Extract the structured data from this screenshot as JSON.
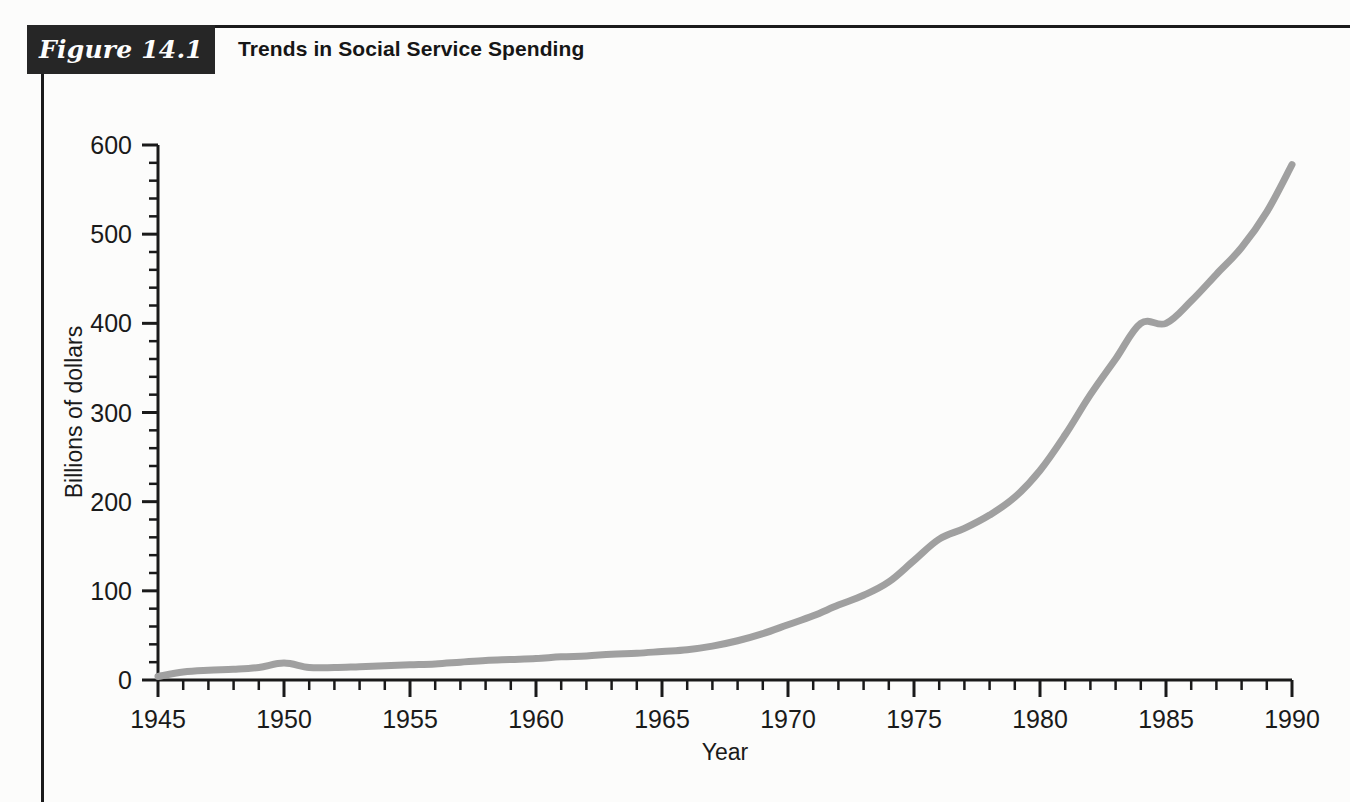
{
  "figure": {
    "tag": "Figure 14.1",
    "title": "Trends in Social Service Spending"
  },
  "chart_data": {
    "type": "line",
    "title": "Trends in Social Service Spending",
    "xlabel": "Year",
    "ylabel": "Billions of dollars",
    "xlim": [
      1945,
      1990
    ],
    "ylim": [
      0,
      600
    ],
    "xticks": [
      1945,
      1950,
      1955,
      1960,
      1965,
      1970,
      1975,
      1980,
      1985,
      1990
    ],
    "xtick_labels": [
      "1945",
      "1950",
      "1955",
      "1960",
      "1965",
      "1970",
      "1975",
      "1980",
      "1985",
      "1990"
    ],
    "x_minor_step": 1,
    "yticks": [
      0,
      100,
      200,
      300,
      400,
      500,
      600
    ],
    "ytick_labels": [
      "0",
      "100",
      "200",
      "300",
      "400",
      "500",
      "600"
    ],
    "y_minor_step": 20,
    "grid": false,
    "legend": null,
    "line_color": "#a0a0a0",
    "line_width": 7,
    "series": [
      {
        "name": "Social service spending",
        "x": [
          1945,
          1946,
          1947,
          1948,
          1949,
          1950,
          1951,
          1952,
          1953,
          1954,
          1955,
          1956,
          1957,
          1958,
          1959,
          1960,
          1961,
          1962,
          1963,
          1964,
          1965,
          1966,
          1967,
          1968,
          1969,
          1970,
          1971,
          1972,
          1973,
          1974,
          1975,
          1976,
          1977,
          1978,
          1979,
          1980,
          1981,
          1982,
          1983,
          1984,
          1985,
          1986,
          1987,
          1988,
          1989,
          1990
        ],
        "values": [
          4,
          9,
          11,
          12,
          14,
          19,
          14,
          14,
          15,
          16,
          17,
          18,
          20,
          22,
          23,
          24,
          26,
          27,
          29,
          30,
          32,
          34,
          38,
          44,
          52,
          62,
          72,
          84,
          95,
          110,
          134,
          158,
          170,
          185,
          205,
          235,
          275,
          320,
          360,
          400,
          400,
          425,
          455,
          485,
          525,
          578
        ]
      }
    ]
  },
  "geometry": {
    "plot_left": 158,
    "plot_right": 1292,
    "plot_bottom": 680,
    "plot_top": 145
  }
}
